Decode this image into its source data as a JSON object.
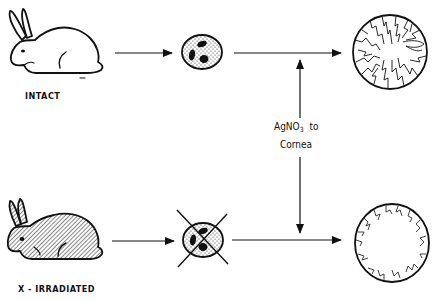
{
  "diagram": {
    "rows": [
      {
        "label": "INTACT",
        "subject": "rabbit",
        "subject_fill": "plain",
        "cell": "granulocyte",
        "cell_crossed_out": false,
        "cornea_result": "extensive vascularization"
      },
      {
        "label": "X - IRRADIATED",
        "subject": "rabbit",
        "subject_fill": "hatched",
        "cell": "granulocyte",
        "cell_crossed_out": true,
        "cornea_result": "minimal peripheral vascularization"
      }
    ],
    "center_label": {
      "line1_main": "AgNO",
      "line1_sub": "3",
      "line1_suffix": "to",
      "line2": "Cornea"
    },
    "colors": {
      "ink": "#111111",
      "background": "#ffffff"
    }
  }
}
